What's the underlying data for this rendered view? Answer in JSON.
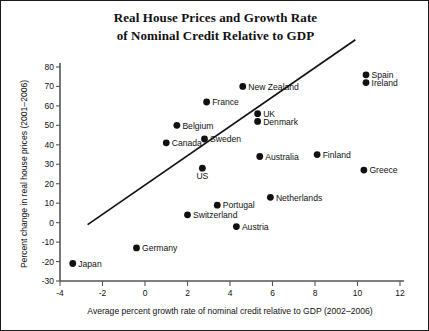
{
  "chart_data": {
    "type": "scatter",
    "title": "Real House Prices and Growth Rate of Nominal Credit Relative to GDP",
    "title_line1": "Real House Prices and Growth Rate",
    "title_line2": "of Nominal Credit Relative to GDP",
    "xlabel": "Average percent growth rate of nominal credit relative to GDP (2002–2006)",
    "ylabel": "Percent change in real house prices (2001–2006)",
    "xlim": [
      -4,
      12
    ],
    "ylim": [
      -30,
      80
    ],
    "xticks": [
      -4,
      -2,
      0,
      2,
      4,
      6,
      8,
      10,
      12
    ],
    "yticks": [
      -30,
      -20,
      -10,
      0,
      10,
      20,
      30,
      40,
      50,
      60,
      70,
      80
    ],
    "grid": false,
    "legend": null,
    "marker_color": "#111111",
    "trendline": {
      "x": [
        -2.7,
        9.9
      ],
      "y": [
        -1,
        94
      ],
      "color": "#111111",
      "visible": true
    },
    "points": [
      {
        "label": "Japan",
        "x": -3.4,
        "y": -21,
        "label_pos": "right"
      },
      {
        "label": "Germany",
        "x": -0.4,
        "y": -13,
        "label_pos": "right"
      },
      {
        "label": "Switzerland",
        "x": 2.0,
        "y": 4,
        "label_pos": "right"
      },
      {
        "label": "Austria",
        "x": 4.3,
        "y": -2,
        "label_pos": "right"
      },
      {
        "label": "Portugal",
        "x": 3.4,
        "y": 9,
        "label_pos": "right"
      },
      {
        "label": "Netherlands",
        "x": 5.9,
        "y": 13,
        "label_pos": "right"
      },
      {
        "label": "US",
        "x": 2.7,
        "y": 28,
        "label_pos": "below"
      },
      {
        "label": "Canada",
        "x": 1.0,
        "y": 41,
        "label_pos": "right"
      },
      {
        "label": "Sweden",
        "x": 2.8,
        "y": 43,
        "label_pos": "right"
      },
      {
        "label": "Belgium",
        "x": 1.5,
        "y": 50,
        "label_pos": "right"
      },
      {
        "label": "France",
        "x": 2.9,
        "y": 62,
        "label_pos": "right"
      },
      {
        "label": "Denmark",
        "x": 5.3,
        "y": 52,
        "label_pos": "right"
      },
      {
        "label": "UK",
        "x": 5.3,
        "y": 56,
        "label_pos": "right"
      },
      {
        "label": "New Zealand",
        "x": 4.6,
        "y": 70,
        "label_pos": "right"
      },
      {
        "label": "Australia",
        "x": 5.4,
        "y": 34,
        "label_pos": "right"
      },
      {
        "label": "Finland",
        "x": 8.1,
        "y": 35,
        "label_pos": "right"
      },
      {
        "label": "Greece",
        "x": 10.3,
        "y": 27,
        "label_pos": "right"
      },
      {
        "label": "Ireland",
        "x": 10.4,
        "y": 72,
        "label_pos": "right"
      },
      {
        "label": "Spain",
        "x": 10.4,
        "y": 76,
        "label_pos": "right"
      }
    ]
  }
}
